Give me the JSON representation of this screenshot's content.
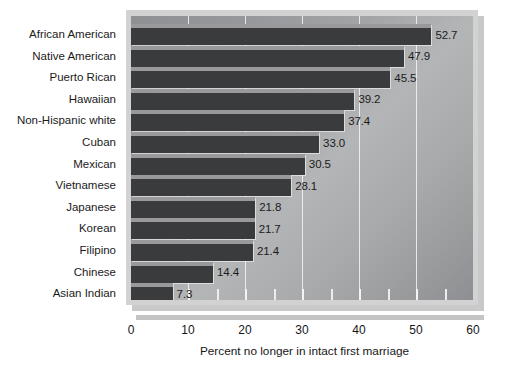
{
  "chart_data": {
    "type": "bar",
    "orientation": "horizontal",
    "title": "",
    "xlabel": "Percent no longer in intact first marriage",
    "ylabel": "",
    "xlim": [
      0,
      60
    ],
    "xticks": [
      0,
      10,
      20,
      30,
      40,
      50,
      60
    ],
    "xtick_labels": [
      "0",
      "10",
      "20",
      "30",
      "40",
      "50",
      "60"
    ],
    "minor_ticks": [
      5,
      15,
      25,
      35,
      45,
      55
    ],
    "grid": true,
    "legend": false,
    "categories": [
      "African American",
      "Native American",
      "Puerto Rican",
      "Hawaiian",
      "Non-Hispanic white",
      "Cuban",
      "Mexican",
      "Vietnamese",
      "Japanese",
      "Korean",
      "Filipino",
      "Chinese",
      "Asian Indian"
    ],
    "values": [
      52.7,
      47.9,
      45.5,
      39.2,
      37.4,
      33.0,
      30.5,
      28.1,
      21.8,
      21.7,
      21.4,
      14.4,
      7.3
    ],
    "value_labels": [
      "52.7",
      "47.9",
      "45.5",
      "39.2",
      "37.4",
      "33.0",
      "30.5",
      "28.1",
      "21.8",
      "21.7",
      "21.4",
      "14.4",
      "7.3"
    ],
    "colors": {
      "bar": "#3a3b3d",
      "bar_highlight": "#bebec0",
      "plot_background_light": "#b4b5b6",
      "plot_background_dark": "#8f9093",
      "frame": "#d2d2d2",
      "gridline": "#fafafa",
      "text": "#1b1b1b",
      "page_background": "#ffffff"
    }
  }
}
